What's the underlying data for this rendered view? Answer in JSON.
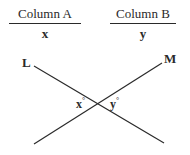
{
  "columns": [
    {
      "title": "Column A",
      "value": "x"
    },
    {
      "title": "Column B",
      "value": "y"
    }
  ],
  "figure": {
    "lines": [
      {
        "label": "L",
        "from": [
          34,
          66
        ],
        "to": [
          164,
          143
        ]
      },
      {
        "label": "M",
        "from": [
          162,
          63
        ],
        "to": [
          34,
          144
        ]
      }
    ],
    "intersection": [
      98,
      104
    ],
    "angles": [
      {
        "label": "x",
        "unit": "°"
      },
      {
        "label": "y",
        "unit": "°"
      }
    ]
  },
  "colors": {
    "ink": "#2a2a2a",
    "background": "#ffffff"
  }
}
